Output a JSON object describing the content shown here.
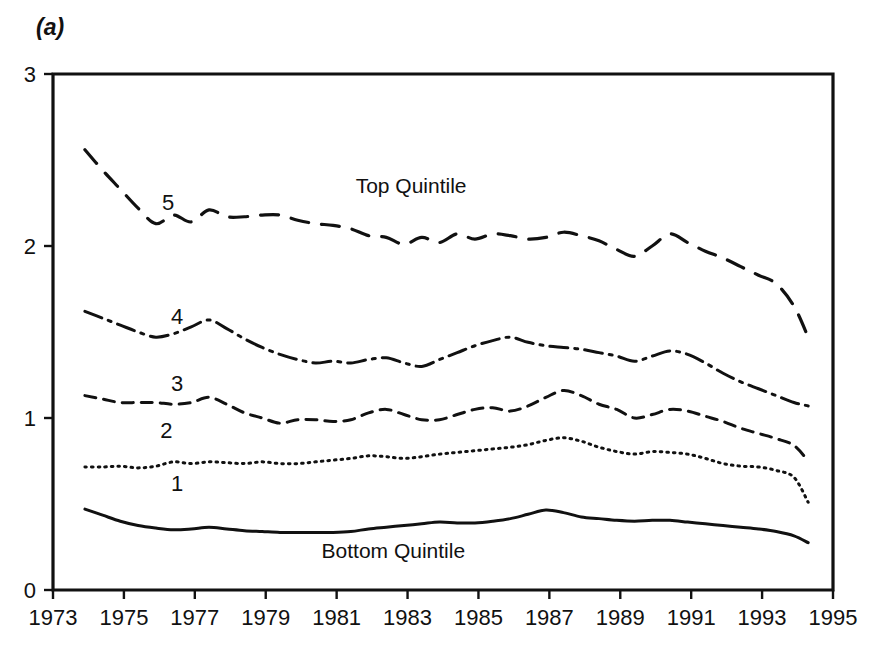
{
  "figure": {
    "panel_label": "(a)",
    "background": "#ffffff",
    "ink_color": "#111111"
  },
  "chart_data": {
    "type": "line",
    "title": "",
    "subtitle": "",
    "xlabel": "",
    "ylabel": "",
    "xlim": [
      1973,
      1995
    ],
    "ylim": [
      0,
      3
    ],
    "grid": false,
    "legend_position": "inline-annotations",
    "x_tick_labels": [
      "1973",
      "1975",
      "1977",
      "1979",
      "1981",
      "1983",
      "1985",
      "1987",
      "1989",
      "1991",
      "1993",
      "1995"
    ],
    "x_ticks": [
      1973,
      1975,
      1977,
      1979,
      1981,
      1983,
      1985,
      1987,
      1989,
      1991,
      1993,
      1995
    ],
    "y_tick_labels": [
      "0",
      "1",
      "2",
      "3"
    ],
    "y_ticks": [
      0,
      1,
      2,
      3
    ],
    "annotations": [
      {
        "text": "Top Quintile",
        "x": 1983.1,
        "y": 2.31
      },
      {
        "text": "Bottom Quintile",
        "x": 1982.6,
        "y": 0.185
      },
      {
        "text": "5",
        "x": 1976.25,
        "y": 2.21
      },
      {
        "text": "4",
        "x": 1976.5,
        "y": 1.545
      },
      {
        "text": "3",
        "x": 1976.5,
        "y": 1.155
      },
      {
        "text": "2",
        "x": 1976.2,
        "y": 0.885
      },
      {
        "text": "1",
        "x": 1976.5,
        "y": 0.575
      }
    ],
    "x": [
      1973.9,
      1974.4,
      1974.9,
      1975.4,
      1975.9,
      1976.4,
      1976.9,
      1977.4,
      1977.9,
      1978.4,
      1978.9,
      1979.4,
      1979.9,
      1980.4,
      1980.9,
      1981.4,
      1981.9,
      1982.4,
      1982.9,
      1983.4,
      1983.9,
      1984.4,
      1984.9,
      1985.4,
      1985.9,
      1986.4,
      1986.9,
      1987.4,
      1987.9,
      1988.4,
      1988.9,
      1989.4,
      1989.9,
      1990.4,
      1990.9,
      1991.4,
      1991.9,
      1992.4,
      1992.9,
      1993.4,
      1993.9,
      1994.3
    ],
    "series": [
      {
        "name": "5",
        "label": "Top Quintile",
        "dash_style": "long-dash",
        "values": [
          2.56,
          2.44,
          2.33,
          2.22,
          2.13,
          2.18,
          2.14,
          2.21,
          2.17,
          2.17,
          2.18,
          2.18,
          2.15,
          2.13,
          2.12,
          2.1,
          2.06,
          2.05,
          2.01,
          2.05,
          2.02,
          2.07,
          2.04,
          2.07,
          2.06,
          2.04,
          2.05,
          2.08,
          2.06,
          2.03,
          1.98,
          1.94,
          2.0,
          2.07,
          2.02,
          1.97,
          1.93,
          1.88,
          1.83,
          1.78,
          1.65,
          1.47
        ]
      },
      {
        "name": "4",
        "label": "",
        "dash_style": "dash-dot",
        "values": [
          1.62,
          1.58,
          1.54,
          1.5,
          1.47,
          1.49,
          1.53,
          1.57,
          1.52,
          1.46,
          1.41,
          1.37,
          1.34,
          1.32,
          1.33,
          1.32,
          1.34,
          1.35,
          1.32,
          1.3,
          1.34,
          1.38,
          1.42,
          1.45,
          1.47,
          1.44,
          1.42,
          1.41,
          1.4,
          1.38,
          1.36,
          1.33,
          1.36,
          1.39,
          1.37,
          1.32,
          1.26,
          1.21,
          1.17,
          1.13,
          1.09,
          1.07
        ]
      },
      {
        "name": "3",
        "label": "",
        "dash_style": "short-dash",
        "values": [
          1.13,
          1.11,
          1.09,
          1.09,
          1.09,
          1.08,
          1.09,
          1.12,
          1.08,
          1.03,
          1.0,
          0.97,
          0.99,
          0.99,
          0.98,
          0.99,
          1.03,
          1.05,
          1.02,
          0.99,
          0.99,
          1.02,
          1.05,
          1.06,
          1.04,
          1.07,
          1.12,
          1.16,
          1.13,
          1.08,
          1.05,
          1.0,
          1.02,
          1.05,
          1.04,
          1.01,
          0.98,
          0.94,
          0.91,
          0.88,
          0.84,
          0.75
        ]
      },
      {
        "name": "2",
        "label": "",
        "dash_style": "dotted",
        "values": [
          0.715,
          0.715,
          0.72,
          0.71,
          0.72,
          0.745,
          0.735,
          0.745,
          0.74,
          0.735,
          0.745,
          0.735,
          0.735,
          0.745,
          0.755,
          0.765,
          0.78,
          0.775,
          0.765,
          0.775,
          0.79,
          0.8,
          0.81,
          0.82,
          0.83,
          0.845,
          0.87,
          0.885,
          0.865,
          0.83,
          0.805,
          0.79,
          0.805,
          0.8,
          0.79,
          0.765,
          0.735,
          0.72,
          0.715,
          0.695,
          0.655,
          0.51
        ]
      },
      {
        "name": "1",
        "label": "Bottom Quintile",
        "dash_style": "solid",
        "values": [
          0.47,
          0.435,
          0.4,
          0.375,
          0.36,
          0.35,
          0.355,
          0.365,
          0.355,
          0.345,
          0.34,
          0.335,
          0.335,
          0.335,
          0.335,
          0.34,
          0.355,
          0.365,
          0.375,
          0.385,
          0.395,
          0.39,
          0.39,
          0.4,
          0.415,
          0.44,
          0.465,
          0.45,
          0.425,
          0.415,
          0.405,
          0.4,
          0.405,
          0.405,
          0.395,
          0.385,
          0.375,
          0.365,
          0.355,
          0.34,
          0.315,
          0.275
        ]
      }
    ]
  }
}
